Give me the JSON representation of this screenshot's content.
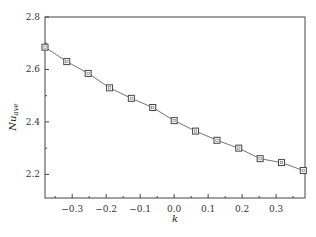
{
  "chart_data": {
    "type": "line",
    "title": "",
    "xlabel": "k",
    "ylabel": "Nu_ave",
    "ylabel_main": "Nu",
    "ylabel_sub": "ave",
    "xlim": [
      -0.38,
      0.385
    ],
    "ylim": [
      2.11,
      2.8
    ],
    "x_ticks": [
      -0.3,
      -0.2,
      -0.1,
      0.0,
      0.1,
      0.2,
      0.3
    ],
    "x_tick_labels": [
      "-0.3",
      "-0.2",
      "-0.1",
      "0.0",
      "0.1",
      "0.2",
      "0.3"
    ],
    "y_ticks": [
      2.2,
      2.4,
      2.6,
      2.8
    ],
    "y_tick_labels": [
      "2.2",
      "2.4",
      "2.6",
      "2.8"
    ],
    "grid": false,
    "legend": null,
    "series": [
      {
        "name": "Nu_ave",
        "marker": "square",
        "color": "#555555",
        "x": [
          -0.38,
          -0.316,
          -0.253,
          -0.19,
          -0.126,
          -0.063,
          0.0,
          0.063,
          0.126,
          0.19,
          0.253,
          0.316,
          0.38
        ],
        "y": [
          2.685,
          2.63,
          2.585,
          2.53,
          2.49,
          2.455,
          2.405,
          2.365,
          2.33,
          2.3,
          2.26,
          2.245,
          2.215
        ]
      }
    ]
  }
}
